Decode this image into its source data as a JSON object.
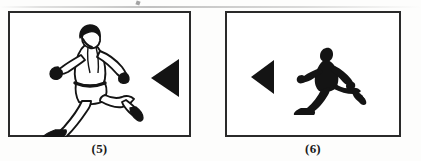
{
  "document": {
    "kind": "scanned-worksheet-figure",
    "background_color": "#fdfdfc",
    "ink_color": "#1a1a1a",
    "frame_color": "#2a2a2a"
  },
  "panels": [
    {
      "id": "panel-5",
      "caption": "(5)",
      "figures": [
        {
          "name": "runner-outline",
          "style": "line-art-outline",
          "description": "man running to the left, outline drawing with dark hair, tank top, shorts and shoes",
          "facing": "left",
          "fill": "#ffffff",
          "stroke": "#141414"
        },
        {
          "name": "triangle-marker",
          "style": "solid",
          "description": "solid triangle pointing left",
          "pointing": "left",
          "fill": "#141414",
          "size": "large"
        }
      ]
    },
    {
      "id": "panel-6",
      "caption": "(6)",
      "figures": [
        {
          "name": "triangle-marker",
          "style": "solid",
          "description": "solid triangle pointing left",
          "pointing": "left",
          "fill": "#141414",
          "size": "small"
        },
        {
          "name": "runner-silhouette",
          "style": "solid-silhouette",
          "description": "man running to the left, filled black silhouette",
          "facing": "left",
          "fill": "#141414",
          "stroke": "none"
        }
      ]
    }
  ]
}
